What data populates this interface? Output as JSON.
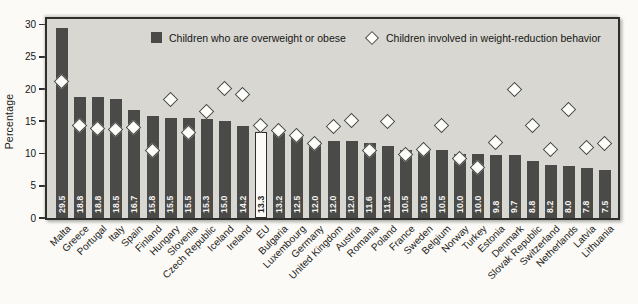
{
  "chart": {
    "ylabel": "Percentage",
    "yticks": [
      0,
      5,
      10,
      15,
      20,
      25,
      30
    ],
    "legend": [
      {
        "marker": "square",
        "label": "Children who are overweight or obese"
      },
      {
        "marker": "diamond",
        "label": "Children involved in weight-reduction behavior"
      }
    ],
    "colors": {
      "bar": "#4a4a48",
      "eu_bar_fill": "#fcfbf7",
      "plot_background": "#d8d7d2",
      "border": "#2e2e2c",
      "diamond_fill": "#fdfdfa",
      "page_background": "#fbfaf6"
    }
  },
  "chart_data": {
    "type": "bar",
    "title": "",
    "xlabel": "",
    "ylabel": "Percentage",
    "ylim": [
      0,
      30
    ],
    "grid": false,
    "legend_position": "top-inside",
    "highlight_category": "EU",
    "categories": [
      "Malta",
      "Greece",
      "Portugal",
      "Italy",
      "Spain",
      "Finland",
      "Hungary",
      "Slovenia",
      "Czech Republic",
      "Iceland",
      "Ireland",
      "EU",
      "Bulgaria",
      "Luxembourg",
      "Germany",
      "United Kingdom",
      "Austria",
      "Romania",
      "Poland",
      "France",
      "Sweden",
      "Belgium",
      "Norway",
      "Turkey",
      "Estonia",
      "Denmark",
      "Slovak Republic",
      "Switzerland",
      "Netherlands",
      "Latvia",
      "Lithuania"
    ],
    "series": [
      {
        "name": "Children who are overweight or obese",
        "type": "bar",
        "values": [
          29.5,
          18.8,
          18.8,
          18.5,
          16.7,
          15.8,
          15.5,
          15.5,
          15.3,
          15.0,
          14.2,
          13.3,
          13.2,
          12.5,
          12.0,
          12.0,
          12.0,
          11.6,
          11.2,
          10.5,
          10.5,
          10.5,
          10.0,
          10.0,
          9.8,
          9.7,
          8.8,
          8.2,
          8.0,
          7.8,
          7.5
        ]
      },
      {
        "name": "Children involved in weight-reduction behavior",
        "type": "scatter-diamond",
        "values": [
          21.1,
          14.2,
          13.8,
          13.6,
          13.9,
          10.4,
          18.3,
          13.2,
          16.5,
          20.0,
          19.0,
          14.2,
          13.5,
          12.7,
          11.4,
          14.1,
          15.1,
          10.4,
          14.9,
          9.7,
          10.6,
          14.2,
          9.1,
          7.8,
          11.7,
          19.9,
          14.3,
          10.5,
          16.7,
          10.9,
          11.4
        ]
      }
    ]
  }
}
